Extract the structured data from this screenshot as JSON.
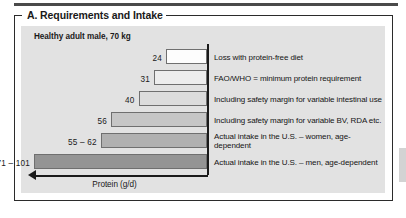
{
  "panel": {
    "title": "A. Requirements and Intake",
    "subtitle": "Healthy adult male, 70 kg"
  },
  "chart_data": {
    "type": "bar",
    "orientation": "horizontal",
    "title": "A. Requirements and Intake",
    "subtitle": "Healthy adult male, 70 kg",
    "xlabel": "Protein (g/d)",
    "ylabel": "",
    "xlim": [
      0,
      101
    ],
    "grid": false,
    "legend": "none",
    "axis_direction": "right-to-left",
    "categories": [
      "Loss with protein-free diet",
      "FAO/WHO = minimum protein requirement",
      "Including safety margin for variable intestinal use",
      "Including safety margin for variable BV, RDA etc.",
      "Actual intake in the U.S. – women, age-dependent",
      "Actual intake in the U.S. – men, age-dependent"
    ],
    "values": [
      24,
      31,
      40,
      56,
      62,
      101
    ],
    "value_labels": [
      "24",
      "31",
      "40",
      "56",
      "55 – 62",
      "71 – 101"
    ],
    "bars": [
      {
        "value_label": "24",
        "value": 24,
        "label": "Loss with protein-free diet",
        "fill": "#fdfdfd",
        "stroke": "#6f6f6f"
      },
      {
        "value_label": "31",
        "value": 31,
        "label": "FAO/WHO = minimum protein requirement",
        "fill": "#ededed",
        "stroke": "#6f6f6f"
      },
      {
        "value_label": "40",
        "value": 40,
        "label": "Including safety margin for variable intestinal use",
        "fill": "#dcdcdc",
        "stroke": "#6f6f6f"
      },
      {
        "value_label": "56",
        "value": 56,
        "label": "Including safety margin for variable BV, RDA etc.",
        "fill": "#c6c6c6",
        "stroke": "#6f6f6f"
      },
      {
        "value_label": "55 – 62",
        "value": 62,
        "label": "Actual intake in the U.S. – women, age-dependent",
        "fill": "#b0b0b0",
        "stroke": "#6f6f6f"
      },
      {
        "value_label": "71 – 101",
        "value": 101,
        "label": "Actual intake in the U.S. – men, age-dependent",
        "fill": "#949494",
        "stroke": "#6f6f6f"
      }
    ]
  },
  "colors": {
    "plate": "#e2e2e2",
    "frame": "#2b2b2b",
    "axis": "#1a1a1a",
    "rule": "#4a4a4a"
  }
}
